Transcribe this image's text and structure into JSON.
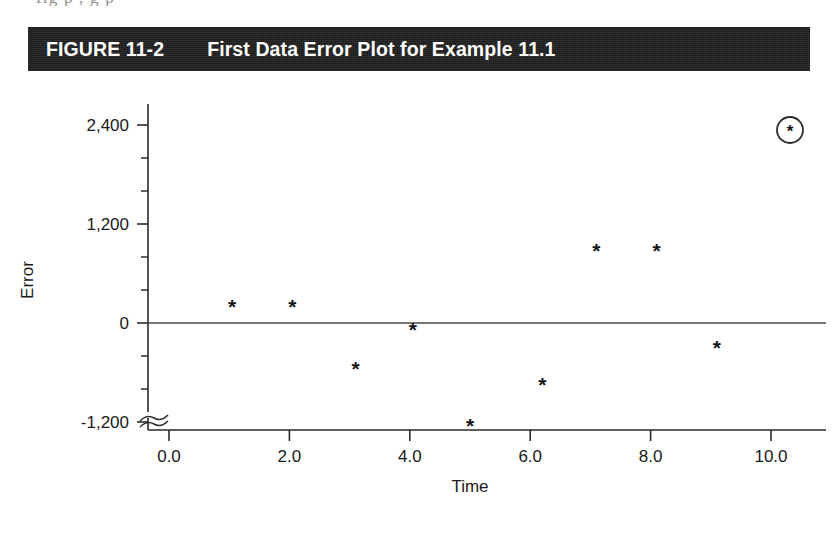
{
  "scan": {
    "top_clipped_text": "fig  p    ,              g   p"
  },
  "figure": {
    "number": "FIGURE 11-2",
    "title": "First Data Error Plot for Example 11.1",
    "bar_color": "#1c1b1c",
    "text_color": "#ffffff"
  },
  "chart_data": {
    "type": "scatter",
    "title": "First Data Error Plot for Example 11.1",
    "xlabel": "Time",
    "ylabel": "Error",
    "xlim": [
      -0.35,
      10.6
    ],
    "ylim": [
      -1300,
      2750
    ],
    "grid": false,
    "legend_position": "top-right",
    "y_axis_break": true,
    "zero_reference_line": true,
    "x_ticks": [
      "0.0",
      "2.0",
      "4.0",
      "6.0",
      "8.0",
      "10.0"
    ],
    "x_tick_values": [
      0,
      2,
      4,
      6,
      8,
      10
    ],
    "y_ticks": [
      "2,400",
      "1,200",
      "0",
      "-1,200"
    ],
    "y_tick_values": [
      2400,
      1200,
      0,
      -1200
    ],
    "y_minor_tick_values": [
      -800,
      -400,
      400,
      800,
      1600,
      2000,
      2800
    ],
    "marker": "*",
    "series": [
      {
        "name": "Error",
        "marker": "*",
        "color": "#141414",
        "x": [
          1.05,
          2.05,
          3.1,
          4.05,
          5.0,
          6.2,
          7.1,
          8.1,
          9.1
        ],
        "y": [
          200,
          200,
          -550,
          -80,
          -1240,
          -750,
          880,
          880,
          -300
        ]
      }
    ],
    "legend": [
      {
        "label": "",
        "marker": "circled-asterisk"
      }
    ]
  }
}
